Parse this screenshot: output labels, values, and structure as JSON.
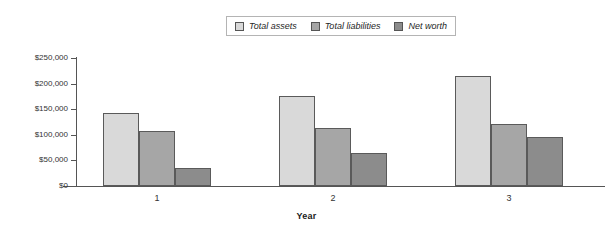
{
  "chart_data": {
    "type": "bar",
    "title": "",
    "subtitle": "",
    "xlabel": "Year",
    "ylabel": "",
    "categories": [
      "1",
      "2",
      "3"
    ],
    "series": [
      {
        "name": "Total assets",
        "color": "#d9d9d9",
        "values": [
          142000,
          176000,
          215000
        ]
      },
      {
        "name": "Total liabilities",
        "color": "#a6a6a6",
        "values": [
          107000,
          114000,
          121000
        ]
      },
      {
        "name": "Net worth",
        "color": "#8c8c8c",
        "values": [
          36000,
          64000,
          95000
        ]
      }
    ],
    "ylim": [
      0,
      250000
    ],
    "ytick_values": [
      0,
      50000,
      100000,
      150000,
      200000,
      250000
    ],
    "ytick_labels": [
      "$0",
      "$50,000",
      "$100,000",
      "$150,000",
      "$200,000",
      "$250,000"
    ],
    "grid": false,
    "legend_position": "top-center",
    "axis_color": "#555555"
  },
  "legend": {
    "entries": [
      {
        "label": "Total assets"
      },
      {
        "label": "Total liabilities"
      },
      {
        "label": "Net worth"
      }
    ]
  },
  "axes": {
    "x_title": "Year"
  }
}
